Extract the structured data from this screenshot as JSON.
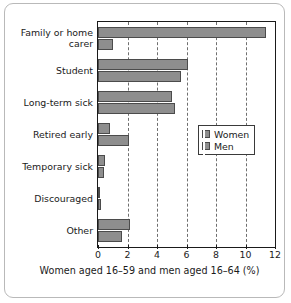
{
  "chart_data": {
    "type": "bar",
    "orientation": "horizontal",
    "title": "",
    "xlabel": "Women aged 16–59 and men aged 16–64 (%)",
    "ylabel": "",
    "xlim": [
      0,
      12
    ],
    "xticks": [
      0,
      2,
      4,
      6,
      8,
      10,
      12
    ],
    "xtick_labels": [
      "0",
      "2",
      "4",
      "6",
      "8",
      "10",
      "12"
    ],
    "grid": "vertical-dashed",
    "legend_position": "center-right",
    "categories": [
      "Family or home carer",
      "Student",
      "Long-term sick",
      "Retired early",
      "Temporary sick",
      "Discouraged",
      "Other"
    ],
    "category_label_lines": [
      [
        "Family or home",
        "carer"
      ],
      [
        "Student"
      ],
      [
        "Long-term sick"
      ],
      [
        "Retired early"
      ],
      [
        "Temporary sick"
      ],
      [
        "Discouraged"
      ],
      [
        "Other"
      ]
    ],
    "series": [
      {
        "name": "Women",
        "color": "#8e8e8e",
        "values": [
          11.4,
          6.1,
          5.0,
          0.8,
          0.5,
          0.1,
          2.2
        ]
      },
      {
        "name": "Men",
        "color": "#8e8e8e",
        "values": [
          1.0,
          5.6,
          5.2,
          2.1,
          0.4,
          0.2,
          1.6
        ]
      }
    ]
  },
  "legend": {
    "entries": [
      {
        "label": "Women"
      },
      {
        "label": "Men"
      }
    ]
  },
  "axis": {
    "title": "Women aged 16–59 and men aged 16–64 (%)"
  }
}
